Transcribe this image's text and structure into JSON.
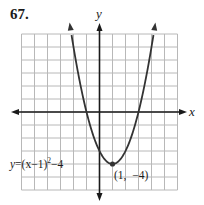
{
  "problem_number": "67.",
  "axes": {
    "x_label": "x",
    "y_label": "y"
  },
  "equation_label": "y = (x − 1)² − 4",
  "equation_parts": {
    "lhs": "y",
    "eq": "=",
    "base": "(x−1)",
    "exp": "2",
    "tail": "−4"
  },
  "point_label": "(1,  −4)",
  "colors": {
    "grid": "#b8b8b8",
    "axis": "#1a1a1a",
    "curve": "#333333",
    "point": "#333333",
    "background": "#ffffff"
  },
  "chart_data": {
    "type": "line",
    "title": "67.",
    "function": "y = (x - 1)^2 - 4",
    "xlabel": "x",
    "ylabel": "y",
    "xlim": [
      -6,
      6
    ],
    "ylim": [
      -6,
      6
    ],
    "grid": true,
    "grid_step": 1,
    "tick_labels": false,
    "series": [
      {
        "name": "y = (x - 1)^2 - 4",
        "x": [
          -2.27,
          -2,
          -1,
          0,
          1,
          2,
          3,
          4,
          4.27
        ],
        "y": [
          6.7,
          5,
          0,
          -3,
          -4,
          -3,
          0,
          5,
          6.7
        ]
      }
    ],
    "annotations": [
      {
        "text": "(1, -4)",
        "x": 1,
        "y": -4,
        "type": "vertex-point"
      },
      {
        "text": "y = (x - 1)^2 - 4",
        "position": "lower-left"
      }
    ],
    "x_intercepts": [
      -1,
      3
    ],
    "y_intercept": -3,
    "vertex": [
      1,
      -4
    ]
  }
}
